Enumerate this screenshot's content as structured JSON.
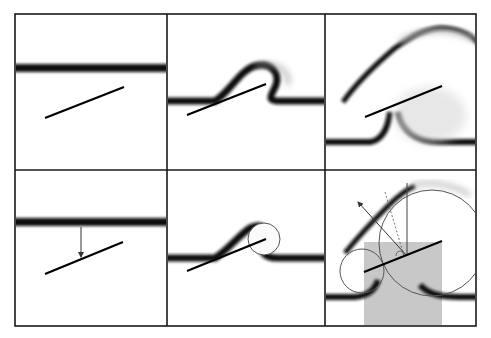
{
  "figure": {
    "width": 491,
    "height": 338,
    "background": "#ffffff",
    "frame_color": "#1a1a1a",
    "grid": {
      "rows": 2,
      "cols": 3,
      "x": [
        15,
        167,
        325,
        476
      ],
      "y": [
        14,
        170,
        326
      ]
    }
  },
  "panels": [
    {
      "id": "p1",
      "row": 0,
      "col": 0,
      "description": "Horizontal thick band above an inclined plate",
      "band_y": 68,
      "plate": [
        [
          45,
          118
        ],
        [
          124,
          87
        ]
      ]
    },
    {
      "id": "p2",
      "row": 0,
      "col": 1,
      "description": "Band deforming over the plate with blurred wrap around the plate tip",
      "band_y": 101,
      "plate": [
        [
          187,
          115
        ],
        [
          266,
          84
        ]
      ]
    },
    {
      "id": "p3",
      "row": 0,
      "col": 2,
      "description": "Band lifted into an arch above the plate; blurred troughs at both sides",
      "band_y": 142,
      "plate": [
        [
          365,
          117
        ],
        [
          442,
          86
        ]
      ]
    },
    {
      "id": "p4",
      "row": 1,
      "col": 0,
      "description": "Horizontal band with a vertical arrow pointing to the plate",
      "band_y": 222,
      "plate": [
        [
          45,
          274
        ],
        [
          123,
          242
        ]
      ],
      "arrow": [
        [
          81,
          228
        ],
        [
          81,
          258
        ]
      ]
    },
    {
      "id": "p5",
      "row": 1,
      "col": 1,
      "description": "Band deforming over plate with outlined circle at the plate tip",
      "band_y": 258,
      "plate": [
        [
          187,
          271
        ],
        [
          266,
          239
        ]
      ],
      "circle": {
        "cx": 264,
        "cy": 239,
        "r": 16
      }
    },
    {
      "id": "p6",
      "row": 1,
      "col": 2,
      "description": "Construction panel: gray shaded region, two tangent circles, direction arrow and dashed guide",
      "band_y": 297,
      "plate": [
        [
          364,
          272
        ],
        [
          442,
          241
        ]
      ],
      "shaded_rect": {
        "x": 364,
        "y": 242,
        "w": 78,
        "h": 84,
        "color": "#c8c8c8"
      },
      "small_circle": {
        "cx": 362,
        "cy": 271,
        "r": 22
      },
      "big_circle": {
        "cx": 432,
        "cy": 243,
        "r": 53
      },
      "vertical_line": [
        [
          407,
          183
        ],
        [
          407,
          253
        ]
      ],
      "arrow": [
        [
          408,
          256
        ],
        [
          357,
          200
        ]
      ],
      "dashed_line": [
        [
          385,
          192
        ],
        [
          405,
          258
        ]
      ]
    }
  ]
}
